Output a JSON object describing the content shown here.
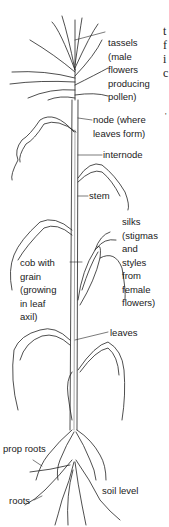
{
  "diagram": {
    "labels": {
      "tassels": [
        "tassels",
        "(male",
        "flowers",
        "producing",
        "pollen)"
      ],
      "node": [
        "node (where",
        "leaves form)"
      ],
      "internode": "internode",
      "stem": "stem",
      "silks": [
        "silks",
        "(stigmas",
        "and",
        "styles",
        "from",
        "female",
        "flowers)"
      ],
      "cob": [
        "cob with",
        "grain",
        "(growing",
        "in leaf",
        "axil)"
      ],
      "leaves": "leaves",
      "prop_roots": "prop roots",
      "roots": "roots",
      "soil_level": "soil level"
    },
    "edge_fragments": [
      "t",
      "f",
      "i",
      "c",
      "'"
    ]
  }
}
